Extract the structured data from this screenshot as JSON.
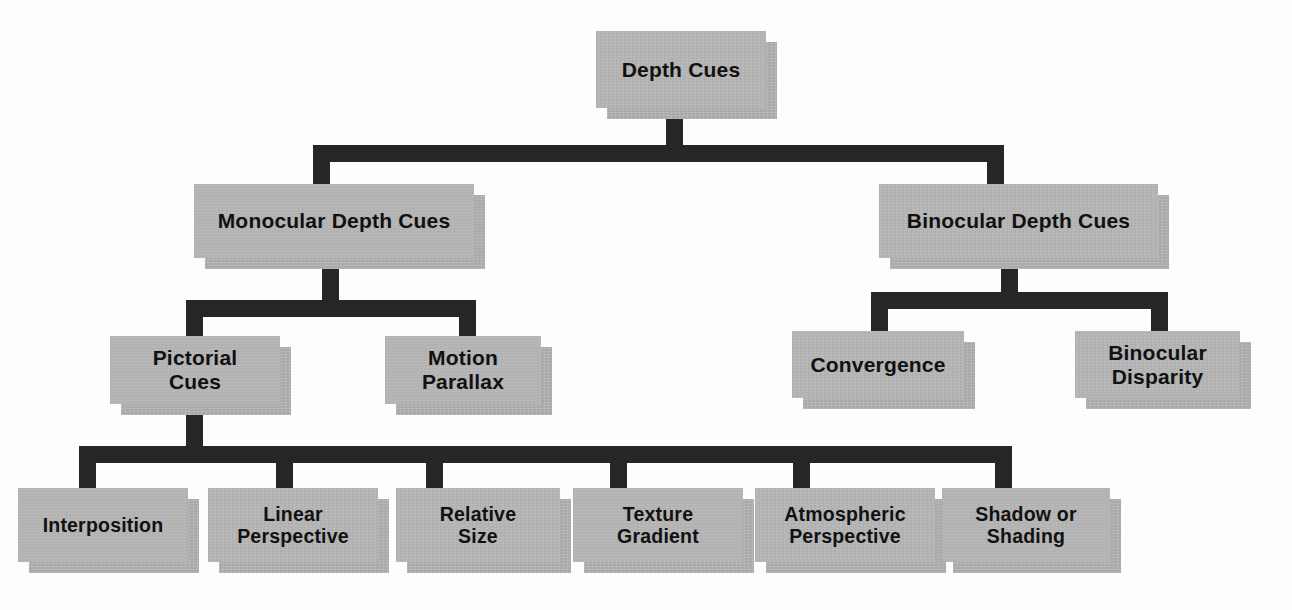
{
  "diagram": {
    "title": "Depth Cues",
    "type": "hierarchy-tree",
    "colors": {
      "box_fill": "#b4b4b4",
      "box_shadow": "#a9a9a9",
      "connector": "#262626",
      "text": "#111111",
      "background": "#fdfdfd"
    },
    "nodes": {
      "root": {
        "label": "Depth Cues"
      },
      "monocular": {
        "label": "Monocular Depth Cues"
      },
      "binocular": {
        "label": "Binocular Depth Cues"
      },
      "pictorial": {
        "label": "Pictorial\nCues"
      },
      "motion_parallax": {
        "label": "Motion\nParallax"
      },
      "convergence": {
        "label": "Convergence"
      },
      "binocular_disparity": {
        "label": "Binocular\nDisparity"
      },
      "interposition": {
        "label": "Interposition"
      },
      "linear_perspective": {
        "label": "Linear\nPerspective"
      },
      "relative_size": {
        "label": "Relative\nSize"
      },
      "texture_gradient": {
        "label": "Texture\nGradient"
      },
      "atmospheric_perspective": {
        "label": "Atmospheric\nPerspective"
      },
      "shadow_or_shading": {
        "label": "Shadow or\nShading"
      }
    },
    "edges": [
      {
        "from": "root",
        "to": "monocular"
      },
      {
        "from": "root",
        "to": "binocular"
      },
      {
        "from": "monocular",
        "to": "pictorial"
      },
      {
        "from": "monocular",
        "to": "motion_parallax"
      },
      {
        "from": "binocular",
        "to": "convergence"
      },
      {
        "from": "binocular",
        "to": "binocular_disparity"
      },
      {
        "from": "pictorial",
        "to": "interposition"
      },
      {
        "from": "pictorial",
        "to": "linear_perspective"
      },
      {
        "from": "pictorial",
        "to": "relative_size"
      },
      {
        "from": "pictorial",
        "to": "texture_gradient"
      },
      {
        "from": "pictorial",
        "to": "atmospheric_perspective"
      },
      {
        "from": "pictorial",
        "to": "shadow_or_shading"
      }
    ]
  }
}
